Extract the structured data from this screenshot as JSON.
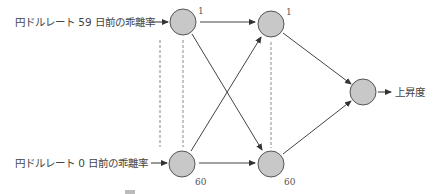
{
  "diagram": {
    "type": "neural-network",
    "inputs": [
      {
        "label": "円ドルレート 59 日前の乖離率",
        "index": "1"
      },
      {
        "label": "円ドルレート 0 日前の乖離率",
        "index": "60"
      }
    ],
    "hidden": [
      {
        "index": "1"
      },
      {
        "index": "60"
      }
    ],
    "output": {
      "label": "上昇度"
    },
    "colors": {
      "node_fill": "#c8c8c8",
      "node_stroke": "#555555",
      "edge": "#444444",
      "dashed": "#888888"
    }
  }
}
